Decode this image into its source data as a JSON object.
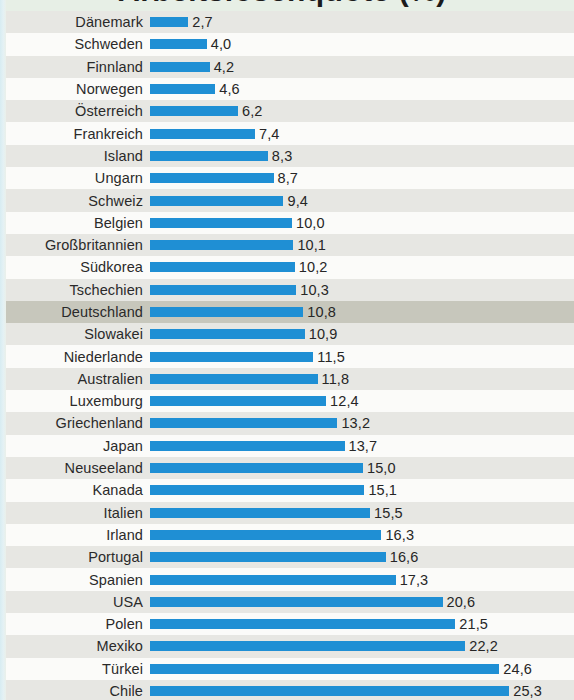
{
  "title": "Arbeitslosenquote (%)",
  "colors": {
    "bar": "#1f8fd4",
    "row_odd": "#e7e7e3",
    "row_even": "#fbfbf9",
    "row_highlight": "#c7c7bc",
    "value_text": "#262626",
    "label_text": "#2a2a2a",
    "page_background": "#edf1eb"
  },
  "highlight_label": "Deutschland",
  "chart_data": {
    "type": "bar",
    "orientation": "horizontal",
    "title": "Arbeitslosenquote (%)",
    "xlabel": "",
    "ylabel": "",
    "xlim": [
      0,
      25.3
    ],
    "grid": false,
    "legend": false,
    "value_format": "comma-decimal",
    "sort": "ascending",
    "highlighted_category": "Deutschland",
    "categories": [
      "Dänemark",
      "Schweden",
      "Finnland",
      "Norwegen",
      "Österreich",
      "Frankreich",
      "Island",
      "Ungarn",
      "Schweiz",
      "Belgien",
      "Großbritannien",
      "Südkorea",
      "Tschechien",
      "Deutschland",
      "Slowakei",
      "Niederlande",
      "Australien",
      "Luxemburg",
      "Griechenland",
      "Japan",
      "Neuseeland",
      "Kanada",
      "Italien",
      "Irland",
      "Portugal",
      "Spanien",
      "USA",
      "Polen",
      "Mexiko",
      "Türkei",
      "Chile"
    ],
    "values": [
      2.7,
      4.0,
      4.2,
      4.6,
      6.2,
      7.4,
      8.3,
      8.7,
      9.4,
      10.0,
      10.1,
      10.2,
      10.3,
      10.8,
      10.9,
      11.5,
      11.8,
      12.4,
      13.2,
      13.7,
      15.0,
      15.1,
      15.5,
      16.3,
      16.6,
      17.3,
      20.6,
      21.5,
      22.2,
      24.6,
      25.3
    ],
    "value_labels": [
      "2,7",
      "4,0",
      "4,2",
      "4,6",
      "6,2",
      "7,4",
      "8,3",
      "8,7",
      "9,4",
      "10,0",
      "10,1",
      "10,2",
      "10,3",
      "10,8",
      "10,9",
      "11,5",
      "11,8",
      "12,4",
      "13,2",
      "13,7",
      "15,0",
      "15,1",
      "15,5",
      "16,3",
      "16,6",
      "17,3",
      "20,6",
      "21,5",
      "22,2",
      "24,6",
      "25,3"
    ]
  },
  "rows": [
    {
      "label": "Dänemark",
      "value": 2.7,
      "display": "2,7"
    },
    {
      "label": "Schweden",
      "value": 4.0,
      "display": "4,0"
    },
    {
      "label": "Finnland",
      "value": 4.2,
      "display": "4,2"
    },
    {
      "label": "Norwegen",
      "value": 4.6,
      "display": "4,6"
    },
    {
      "label": "Österreich",
      "value": 6.2,
      "display": "6,2"
    },
    {
      "label": "Frankreich",
      "value": 7.4,
      "display": "7,4"
    },
    {
      "label": "Island",
      "value": 8.3,
      "display": "8,3"
    },
    {
      "label": "Ungarn",
      "value": 8.7,
      "display": "8,7"
    },
    {
      "label": "Schweiz",
      "value": 9.4,
      "display": "9,4"
    },
    {
      "label": "Belgien",
      "value": 10.0,
      "display": "10,0"
    },
    {
      "label": "Großbritannien",
      "value": 10.1,
      "display": "10,1"
    },
    {
      "label": "Südkorea",
      "value": 10.2,
      "display": "10,2"
    },
    {
      "label": "Tschechien",
      "value": 10.3,
      "display": "10,3"
    },
    {
      "label": "Deutschland",
      "value": 10.8,
      "display": "10,8"
    },
    {
      "label": "Slowakei",
      "value": 10.9,
      "display": "10,9"
    },
    {
      "label": "Niederlande",
      "value": 11.5,
      "display": "11,5"
    },
    {
      "label": "Australien",
      "value": 11.8,
      "display": "11,8"
    },
    {
      "label": "Luxemburg",
      "value": 12.4,
      "display": "12,4"
    },
    {
      "label": "Griechenland",
      "value": 13.2,
      "display": "13,2"
    },
    {
      "label": "Japan",
      "value": 13.7,
      "display": "13,7"
    },
    {
      "label": "Neuseeland",
      "value": 15.0,
      "display": "15,0"
    },
    {
      "label": "Kanada",
      "value": 15.1,
      "display": "15,1"
    },
    {
      "label": "Italien",
      "value": 15.5,
      "display": "15,5"
    },
    {
      "label": "Irland",
      "value": 16.3,
      "display": "16,3"
    },
    {
      "label": "Portugal",
      "value": 16.6,
      "display": "16,6"
    },
    {
      "label": "Spanien",
      "value": 17.3,
      "display": "17,3"
    },
    {
      "label": "USA",
      "value": 20.6,
      "display": "20,6"
    },
    {
      "label": "Polen",
      "value": 21.5,
      "display": "21,5"
    },
    {
      "label": "Mexiko",
      "value": 22.2,
      "display": "22,2"
    },
    {
      "label": "Türkei",
      "value": 24.6,
      "display": "24,6"
    },
    {
      "label": "Chile",
      "value": 25.3,
      "display": "25,3"
    }
  ]
}
